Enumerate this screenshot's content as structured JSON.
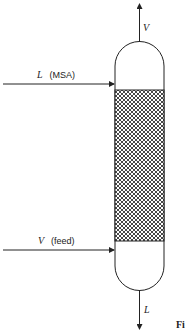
{
  "diagram": {
    "type": "packed-column-absorber",
    "streams": {
      "top_out": {
        "symbol": "V",
        "direction": "up"
      },
      "top_in": {
        "symbol": "L",
        "note": "(MSA)",
        "direction": "right"
      },
      "bottom_in": {
        "symbol": "V",
        "note": "(feed)",
        "direction": "right"
      },
      "bottom_out": {
        "symbol": "L",
        "direction": "down"
      }
    },
    "packing": {
      "pattern": "crosshatch"
    },
    "caption_fragment": "Fi"
  }
}
